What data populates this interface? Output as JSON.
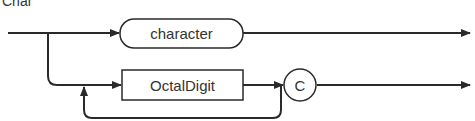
{
  "diagram": {
    "title": "Char",
    "type": "syntax-diagram",
    "nodes": [
      {
        "id": "character",
        "label": "character",
        "shape": "rounded-terminal"
      },
      {
        "id": "octaldigit",
        "label": "OctalDigit",
        "shape": "rectangle-nonterminal"
      },
      {
        "id": "c",
        "label": "C",
        "shape": "circle-terminal"
      }
    ],
    "paths": [
      "entry -> character -> exit",
      "entry -> OctalDigit -> C -> exit",
      "OctalDigit -> loop back -> OctalDigit"
    ],
    "colors": {
      "stroke": "#2a2a2a",
      "text": "#333333",
      "background": "#ffffff"
    }
  }
}
